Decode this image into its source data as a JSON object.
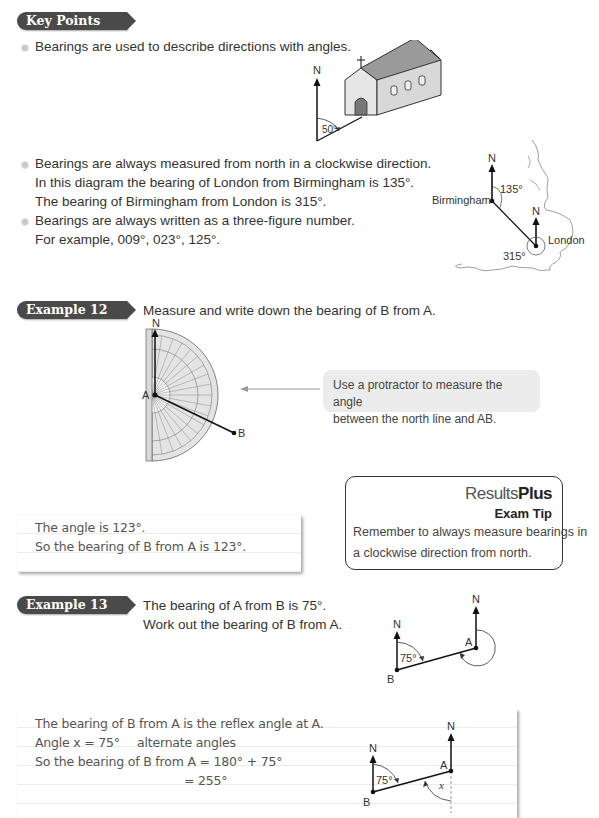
{
  "key_points": {
    "tag": "Key Points",
    "bullets": [
      {
        "lines": [
          "Bearings are used to describe directions with angles."
        ]
      },
      {
        "lines": [
          "Bearings are always measured from north in a clockwise direction.",
          "In this diagram the bearing of London from Birmingham is 135°.",
          "The bearing of Birmingham from London is 315°."
        ]
      },
      {
        "lines": [
          "Bearings are always written as a three-figure number.",
          "For example, 009°, 023°, 125°."
        ]
      }
    ],
    "church_diagram": {
      "north_label": "N",
      "angle_label": "50°"
    },
    "map_diagram": {
      "north_label_1": "N",
      "north_label_2": "N",
      "city_1": "Birmingham",
      "city_2": "London",
      "angle_1": "135°",
      "angle_2": "315°"
    }
  },
  "example12": {
    "tag": "Example 12",
    "question": "Measure and write down the bearing of B from A.",
    "diagram": {
      "north_label": "N",
      "point_a": "A",
      "point_b": "B"
    },
    "callout": [
      "Use a protractor to measure the angle",
      "between the north line and AB."
    ],
    "answer": [
      "The angle is 123°.",
      "So the bearing of B from A is 123°."
    ]
  },
  "exam_tip": {
    "brand_regular": "Results",
    "brand_bold": "Plus",
    "title": "Exam Tip",
    "lines": [
      "Remember to always measure bearings in",
      "a clockwise direction from north."
    ]
  },
  "example13": {
    "tag": "Example 13",
    "question": [
      "The bearing of A from B is 75°.",
      "Work out the bearing of B from A."
    ],
    "diagram": {
      "north_label_b": "N",
      "north_label_a": "N",
      "point_a": "A",
      "point_b": "B",
      "angle_label": "75°"
    },
    "answer": {
      "line1": "The bearing of B from A is the reflex angle at A.",
      "line2_left": "Angle x = 75°",
      "line2_right": "alternate angles",
      "line3": "So the bearing of B from A = 180° + 75°",
      "line4": "= 255°"
    },
    "answer_diagram": {
      "north_label_b": "N",
      "north_label_a": "N",
      "point_a": "A",
      "point_b": "B",
      "angle_label": "75°",
      "angle_x": "x"
    }
  }
}
